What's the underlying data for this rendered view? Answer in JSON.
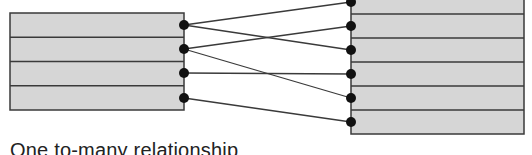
{
  "caption": "One to-many relationship",
  "colors": {
    "fill": "#d6d6d6",
    "stroke": "#3a3a3a",
    "dot": "#111111"
  },
  "left_table": {
    "x": 10,
    "y": 13,
    "width": 174,
    "rows": 4,
    "row_height": 24.25
  },
  "right_table": {
    "x": 351,
    "y": -10,
    "width": 173,
    "rows": 6,
    "row_height": 24
  },
  "left_dots_y": [
    25,
    49,
    73,
    98
  ],
  "right_dots_y": [
    2,
    26,
    50,
    74,
    98,
    122
  ],
  "connections": [
    {
      "from": 0,
      "to": 0
    },
    {
      "from": 0,
      "to": 2
    },
    {
      "from": 1,
      "to": 1
    },
    {
      "from": 1,
      "to": 4
    },
    {
      "from": 2,
      "to": 3
    },
    {
      "from": 3,
      "to": 5
    }
  ]
}
